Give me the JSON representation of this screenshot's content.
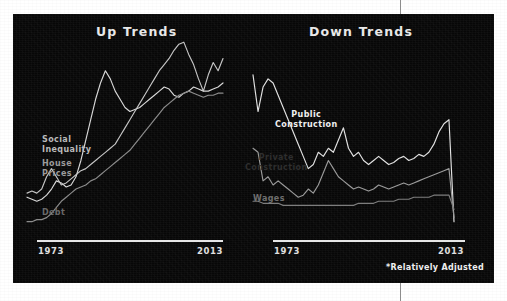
{
  "figure": {
    "footnote": "*Relatively Adjusted",
    "panel_background": "#070707",
    "divider_color": "#8d8d8d"
  },
  "charts": {
    "up": {
      "title": "Up Trends",
      "axis_start": "1973",
      "axis_end": "2013",
      "labels": {
        "social_inequality": "Social\nInequality",
        "house_prices": "House\nPrices",
        "debt": "Debt"
      }
    },
    "down": {
      "title": "Down Trends",
      "axis_start": "1973",
      "axis_end": "2013",
      "labels": {
        "public_construction": "Public\nConstruction",
        "private_construction": "Private\nConstruction",
        "wages": "Wages"
      }
    }
  },
  "chart_data": [
    {
      "type": "line",
      "title": "Up Trends",
      "xlabel": "",
      "ylabel": "",
      "xlim": [
        1973,
        2013
      ],
      "ylim": [
        0,
        100
      ],
      "grid": false,
      "legend": "inline-labels-left",
      "x": [
        1973,
        1974,
        1975,
        1976,
        1977,
        1978,
        1979,
        1980,
        1981,
        1982,
        1983,
        1984,
        1985,
        1986,
        1987,
        1988,
        1989,
        1990,
        1991,
        1992,
        1993,
        1994,
        1995,
        1996,
        1997,
        1998,
        1999,
        2000,
        2001,
        2002,
        2003,
        2004,
        2005,
        2006,
        2007,
        2008,
        2009,
        2010,
        2011,
        2012,
        2013
      ],
      "series": [
        {
          "name": "Social Inequality",
          "color": "#d8d8d8",
          "values": [
            20,
            19,
            18,
            19,
            21,
            24,
            28,
            27,
            25,
            26,
            30,
            38,
            48,
            58,
            68,
            76,
            82,
            78,
            72,
            68,
            64,
            62,
            63,
            64,
            66,
            68,
            70,
            72,
            74,
            73,
            70,
            69,
            71,
            72,
            74,
            73,
            72,
            72,
            73,
            74,
            76
          ]
        },
        {
          "name": "House Prices",
          "color": "#c6c6c6",
          "values": [
            22,
            23,
            22,
            24,
            30,
            34,
            30,
            26,
            27,
            29,
            31,
            33,
            34,
            36,
            38,
            40,
            42,
            44,
            46,
            50,
            54,
            58,
            62,
            66,
            70,
            74,
            78,
            82,
            85,
            88,
            92,
            95,
            96,
            90,
            85,
            78,
            72,
            80,
            86,
            82,
            88
          ]
        },
        {
          "name": "Debt",
          "color": "#8c8c8c",
          "values": [
            8,
            8,
            9,
            9,
            10,
            12,
            15,
            18,
            20,
            22,
            24,
            25,
            26,
            28,
            29,
            31,
            33,
            35,
            37,
            39,
            41,
            43,
            46,
            49,
            52,
            55,
            58,
            61,
            64,
            66,
            68,
            70,
            71,
            72,
            71,
            70,
            69,
            70,
            70,
            71,
            71
          ]
        }
      ]
    },
    {
      "type": "line",
      "title": "Down Trends",
      "xlabel": "",
      "ylabel": "",
      "xlim": [
        1973,
        2013
      ],
      "ylim": [
        0,
        100
      ],
      "grid": false,
      "legend": "inline-labels",
      "x": [
        1973,
        1974,
        1975,
        1976,
        1977,
        1978,
        1979,
        1980,
        1981,
        1982,
        1983,
        1984,
        1985,
        1986,
        1987,
        1988,
        1989,
        1990,
        1991,
        1992,
        1993,
        1994,
        1995,
        1996,
        1997,
        1998,
        1999,
        2000,
        2001,
        2002,
        2003,
        2004,
        2005,
        2006,
        2007,
        2008,
        2009,
        2010,
        2011,
        2012,
        2013
      ],
      "series": [
        {
          "name": "Public Construction",
          "color": "#e2e2e2",
          "values": [
            80,
            62,
            74,
            78,
            76,
            70,
            64,
            58,
            52,
            46,
            40,
            34,
            36,
            42,
            40,
            44,
            42,
            48,
            54,
            44,
            40,
            42,
            38,
            36,
            38,
            40,
            38,
            36,
            37,
            39,
            40,
            38,
            39,
            41,
            40,
            42,
            46,
            52,
            56,
            58,
            8
          ]
        },
        {
          "name": "Private Construction",
          "color": "#9a9a9a",
          "values": [
            44,
            42,
            28,
            30,
            26,
            28,
            26,
            24,
            22,
            20,
            21,
            24,
            22,
            26,
            32,
            38,
            34,
            30,
            28,
            26,
            24,
            25,
            24,
            23,
            24,
            26,
            25,
            24,
            25,
            26,
            27,
            26,
            27,
            28,
            29,
            30,
            31,
            32,
            33,
            34,
            10
          ]
        },
        {
          "name": "Wages",
          "color": "#7d7d7d",
          "values": [
            18,
            18,
            17,
            17,
            17,
            17,
            16,
            16,
            16,
            16,
            16,
            16,
            16,
            16,
            16,
            16,
            16,
            16,
            16,
            16,
            16,
            17,
            17,
            17,
            17,
            18,
            18,
            18,
            18,
            19,
            19,
            19,
            20,
            20,
            20,
            20,
            21,
            21,
            21,
            21,
            14
          ]
        }
      ]
    }
  ]
}
